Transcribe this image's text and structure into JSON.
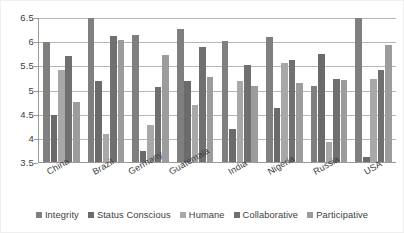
{
  "chart_data": {
    "type": "bar",
    "title": "",
    "subtitle": "",
    "xlabel": "",
    "ylabel": "",
    "ylim": [
      3.5,
      6.5
    ],
    "ytick_step": 0.5,
    "yticks": [
      "6.5",
      "6",
      "5.5",
      "5",
      "4.5",
      "4",
      "3.5"
    ],
    "ytick_values": [
      6.5,
      6.0,
      5.5,
      5.0,
      4.5,
      4.0,
      3.5
    ],
    "grid": true,
    "grid_axis": "y",
    "legend_position": "bottom",
    "bar_orientation": "vertical",
    "categories": [
      "China",
      "Brazil",
      "Germany",
      "Guatemala",
      "India",
      "Nigeria",
      "Russia",
      "USA"
    ],
    "series": [
      {
        "name": "Integrity",
        "color": "#7f7f7f",
        "values": [
          5.98,
          6.62,
          6.12,
          6.25,
          6.0,
          6.08,
          5.08,
          6.62
        ],
        "clipped": [
          false,
          true,
          false,
          false,
          false,
          false,
          false,
          true
        ]
      },
      {
        "name": "Status Conscious",
        "color": "#6b6b6b",
        "values": [
          4.48,
          5.17,
          3.72,
          5.18,
          4.19,
          4.62,
          5.73,
          3.61
        ],
        "clipped": [
          false,
          false,
          false,
          false,
          false,
          false,
          false,
          false
        ]
      },
      {
        "name": "Humane",
        "color": "#a8a8a8",
        "values": [
          5.4,
          4.08,
          4.27,
          4.68,
          5.18,
          5.55,
          3.92,
          5.22
        ],
        "clipped": [
          false,
          false,
          false,
          false,
          false,
          false,
          false,
          false
        ]
      },
      {
        "name": "Collaborative",
        "color": "#707070",
        "values": [
          5.7,
          6.1,
          5.05,
          5.87,
          5.51,
          5.61,
          5.21,
          5.4
        ],
        "clipped": [
          false,
          false,
          false,
          false,
          false,
          false,
          false,
          false
        ]
      },
      {
        "name": "Participative",
        "color": "#9c9c9c",
        "values": [
          4.75,
          6.03,
          5.72,
          5.25,
          5.07,
          5.13,
          5.2,
          5.92
        ],
        "clipped": [
          false,
          false,
          false,
          false,
          false,
          false,
          false,
          false
        ]
      }
    ]
  },
  "legend": {
    "items": [
      {
        "label": "Integrity",
        "color": "#7f7f7f"
      },
      {
        "label": "Status Conscious",
        "color": "#6b6b6b"
      },
      {
        "label": "Humane",
        "color": "#a8a8a8"
      },
      {
        "label": "Collaborative",
        "color": "#707070"
      },
      {
        "label": "Participative",
        "color": "#9c9c9c"
      }
    ]
  },
  "axis": {
    "y_min": 3.5,
    "y_max": 6.5,
    "axis_color": "#9a9a9a",
    "grid_color": "#b6b6b6",
    "text_color": "#3d3d3d"
  }
}
